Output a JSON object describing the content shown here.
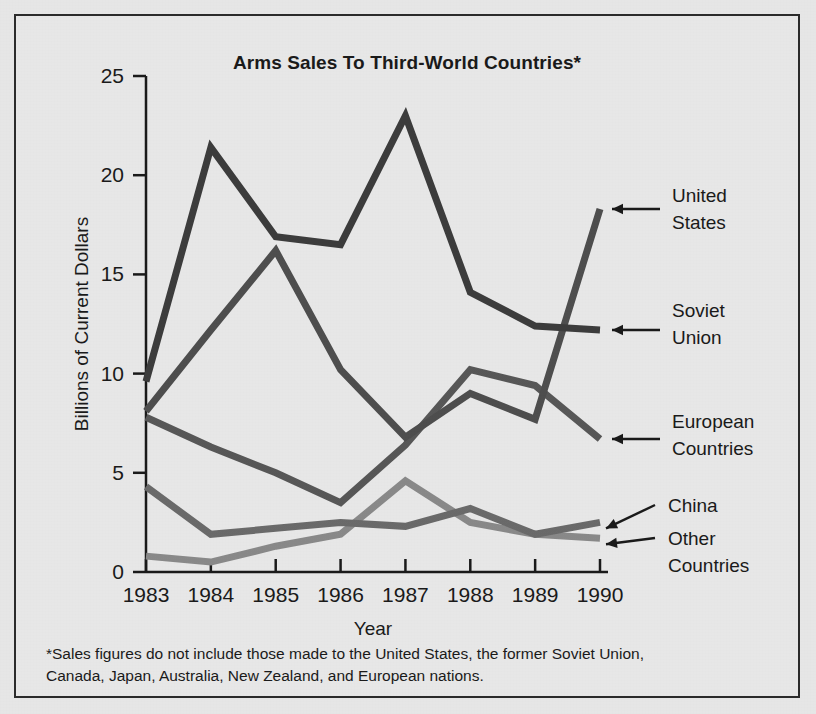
{
  "figure": {
    "title": "Arms Sales To Third-World Countries*",
    "footnote_line_1": "*Sales figures do not include those made to the United States, the former Soviet Union,",
    "footnote_line_2": "Canada, Japan, Australia, New Zealand, and European nations.",
    "background_color": "#e8e8e8",
    "border_color": "#2b2b2b"
  },
  "chart_data": {
    "type": "line",
    "title": "Arms Sales To Third-World Countries*",
    "xlabel": "Year",
    "ylabel": "Billions of Current Dollars",
    "categories": [
      "1983",
      "1984",
      "1985",
      "1986",
      "1987",
      "1988",
      "1989",
      "1990"
    ],
    "x": [
      1983,
      1984,
      1985,
      1986,
      1987,
      1988,
      1989,
      1990
    ],
    "xlim": [
      1983,
      1990
    ],
    "ylim": [
      0,
      25
    ],
    "yticks": [
      0,
      5,
      10,
      15,
      20,
      25
    ],
    "ytick_labels": [
      "0",
      "5",
      "10",
      "15",
      "20",
      "25"
    ],
    "grid": false,
    "legend_position": "right-annotations",
    "series": [
      {
        "name": "United States",
        "color": "#3c3c3c",
        "values": [
          9.6,
          21.4,
          16.9,
          16.5,
          23.0,
          14.1,
          12.4,
          12.2
        ]
      },
      {
        "name": "Soviet Union",
        "color": "#4e4e4e",
        "values": [
          8.1,
          12.2,
          16.2,
          10.2,
          6.8,
          9.0,
          7.7,
          18.3
        ]
      },
      {
        "name": "European Countries",
        "color": "#585858",
        "values": [
          7.8,
          6.3,
          5.0,
          3.5,
          6.4,
          10.2,
          9.4,
          6.7
        ]
      },
      {
        "name": "China",
        "color": "#6b6b6b",
        "values": [
          4.3,
          1.9,
          2.2,
          2.5,
          2.3,
          3.2,
          1.9,
          2.5
        ]
      },
      {
        "name": "Other Countries",
        "color": "#8a8a8a",
        "values": [
          0.8,
          0.5,
          1.3,
          1.9,
          4.6,
          2.5,
          1.9,
          1.7
        ]
      }
    ],
    "annotations": [
      {
        "label_line_1": "United",
        "label_line_2": "States",
        "series": "United States"
      },
      {
        "label_line_1": "Soviet",
        "label_line_2": "Union",
        "series": "Soviet Union"
      },
      {
        "label_line_1": "European",
        "label_line_2": "Countries",
        "series": "European Countries"
      },
      {
        "label_line_1": "China",
        "label_line_2": "",
        "series": "China"
      },
      {
        "label_line_1": "Other",
        "label_line_2": "Countries",
        "series": "Other Countries"
      }
    ]
  }
}
